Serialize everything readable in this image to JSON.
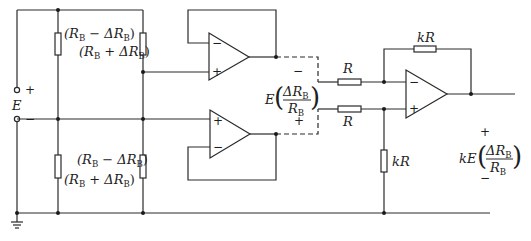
{
  "diagram": {
    "type": "instrumentation-amplifier-bridge-circuit",
    "source": {
      "label": "E",
      "plus": "+",
      "minus": "−"
    },
    "bridge": {
      "top_left_resistor": {
        "label": "(R",
        "sub": "B",
        "op": " − ΔR",
        "sub2": "B",
        "close": ")"
      },
      "top_right_resistor": {
        "label": "(R",
        "sub": "B",
        "op": " + ΔR",
        "sub2": "B",
        "close": ")"
      },
      "bottom_left_resistor": {
        "label": "(R",
        "sub": "B",
        "op": " + ΔR",
        "sub2": "B",
        "close": ")"
      },
      "bottom_right_resistor": {
        "label": "(R",
        "sub": "B",
        "op": " − ΔR",
        "sub2": "B",
        "close": ")"
      }
    },
    "buffer_opamps": [
      {
        "name": "buffer-top",
        "inv": "−",
        "noninv": "+"
      },
      {
        "name": "buffer-bottom",
        "inv": "−",
        "noninv": "+"
      }
    ],
    "differential_voltage": {
      "prefix": "E",
      "numerator": "ΔR",
      "numerator_sub": "B",
      "denominator": "R",
      "denominator_sub": "B",
      "top_sign": "−",
      "bottom_sign": "+"
    },
    "diff_amp": {
      "input_resistor_top": "R",
      "input_resistor_bottom": "R",
      "feedback_resistor": "kR",
      "ground_resistor": "kR",
      "inv": "−",
      "noninv": "+"
    },
    "output": {
      "prefix": "kE",
      "numerator": "ΔR",
      "numerator_sub": "B",
      "denominator": "R",
      "denominator_sub": "B",
      "top_sign": "+",
      "bottom_sign": "−"
    },
    "colors": {
      "line": "#2a2a2a",
      "background": "#ffffff"
    }
  }
}
